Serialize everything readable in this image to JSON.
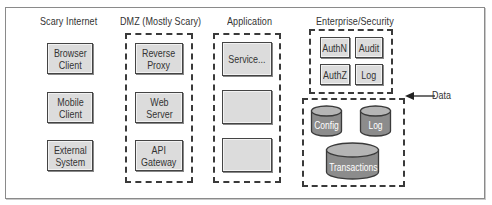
{
  "columns": {
    "scary_internet": {
      "title": "Scary Internet",
      "boxes": [
        "Browser\nClient",
        "Mobile\nClient",
        "External\nSystem"
      ]
    },
    "dmz": {
      "title": "DMZ (Mostly Scary)",
      "boxes": [
        "Reverse\nProxy",
        "Web\nServer",
        "API\nGateway"
      ]
    },
    "application": {
      "title": "Application",
      "boxes": [
        "Service...",
        "",
        ""
      ]
    },
    "enterprise_security": {
      "title": "Enterprise/Security",
      "boxes": [
        "AuthN",
        "Audit",
        "AuthZ",
        "Log"
      ]
    },
    "data": {
      "label": "Data",
      "stores": [
        "Config",
        "Log",
        "Transactions"
      ]
    }
  },
  "colors": {
    "box_fill": "#dcdcdc",
    "cylinder_fill": "#8c8c8c",
    "cylinder_top": "#b5b5b5",
    "border": "#3a3a3a"
  }
}
